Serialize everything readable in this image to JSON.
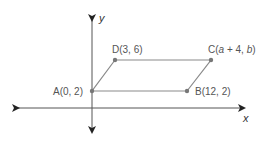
{
  "diagram": {
    "type": "coordinate-plane-parallelogram",
    "axes": {
      "x_label": "x",
      "y_label": "y"
    },
    "colors": {
      "axis": "#333333",
      "shape_edge": "#8a8a8a",
      "point": "#777777",
      "label": "#555555"
    },
    "points": [
      {
        "id": "A",
        "label": "A(0, 2)",
        "x": 0,
        "y": 2
      },
      {
        "id": "B",
        "label": "B(12, 2)",
        "x": 12,
        "y": 2
      },
      {
        "id": "C",
        "label_prefix": "C(",
        "label_a": "a",
        "label_mid": " + 4, ",
        "label_b": "b",
        "label_suffix": ")"
      },
      {
        "id": "D",
        "label": "D(3, 6)",
        "x": 3,
        "y": 6
      }
    ],
    "edges": [
      "A-B",
      "B-C",
      "C-D",
      "D-A"
    ]
  }
}
